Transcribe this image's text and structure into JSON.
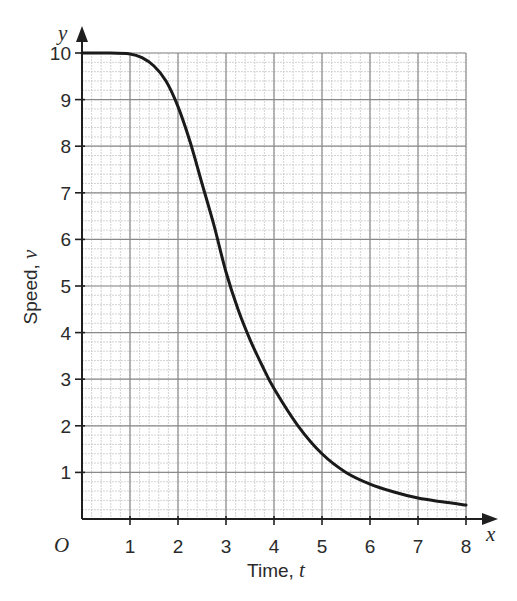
{
  "chart_data": {
    "type": "line",
    "title": "",
    "xlabel": "Time, t",
    "ylabel": "Speed, v",
    "xlabel_text": "Time, ",
    "xlabel_var": "t",
    "ylabel_text": "Speed, ",
    "ylabel_var": "v",
    "x_axis_var": "x",
    "y_axis_var": "y",
    "origin_label": "O",
    "xlim": [
      0,
      8
    ],
    "ylim": [
      0,
      10
    ],
    "x_ticks": [
      1,
      2,
      3,
      4,
      5,
      6,
      7,
      8
    ],
    "y_ticks": [
      1,
      2,
      3,
      4,
      5,
      6,
      7,
      8,
      9,
      10
    ],
    "grid": true,
    "grid_minor_divisions": 5,
    "legend": null,
    "series": [
      {
        "name": "v(t)",
        "color": "#1a1a1a",
        "x": [
          0,
          0.5,
          1,
          1.25,
          1.5,
          1.75,
          2,
          2.25,
          2.5,
          2.75,
          3,
          3.25,
          3.5,
          3.75,
          4,
          4.5,
          5,
          5.5,
          6,
          6.5,
          7,
          7.5,
          8
        ],
        "y": [
          10,
          10,
          9.98,
          9.9,
          9.72,
          9.4,
          8.85,
          8.1,
          7.2,
          6.3,
          5.3,
          4.5,
          3.85,
          3.3,
          2.8,
          2.0,
          1.4,
          1.0,
          0.75,
          0.58,
          0.45,
          0.37,
          0.3
        ]
      }
    ]
  },
  "colors": {
    "axis": "#1f1f1f",
    "grid_major": "#8a8a8a",
    "grid_minor": "#c8c8c8",
    "curve": "#1a1a1a",
    "text": "#2a2a2a"
  }
}
